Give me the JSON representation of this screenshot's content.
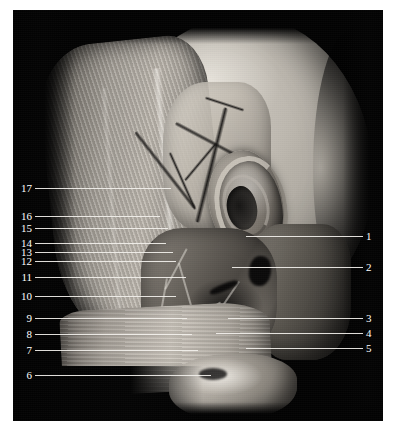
{
  "figure": {
    "kind": "anatomical-dissection-photograph",
    "plate_background": "#030303",
    "page_background": "#ffffff",
    "label_color": "#ffffff",
    "leader_color": "#f2f0ec"
  },
  "labels_left": [
    {
      "number": "17",
      "y": 188,
      "line_x": 35,
      "line_width": 136
    },
    {
      "number": "16",
      "y": 216,
      "line_x": 35,
      "line_width": 125
    },
    {
      "number": "15",
      "y": 228,
      "line_x": 35,
      "line_width": 133
    },
    {
      "number": "14",
      "y": 243,
      "line_x": 35,
      "line_width": 131
    },
    {
      "number": "13",
      "y": 252,
      "line_x": 35,
      "line_width": 138
    },
    {
      "number": "12",
      "y": 261,
      "line_x": 35,
      "line_width": 141
    },
    {
      "number": "11",
      "y": 277,
      "line_x": 35,
      "line_width": 151
    },
    {
      "number": "10",
      "y": 296,
      "line_x": 35,
      "line_width": 141
    },
    {
      "number": "9",
      "y": 318,
      "line_x": 35,
      "line_width": 152
    },
    {
      "number": "8",
      "y": 334,
      "line_x": 35,
      "line_width": 157
    },
    {
      "number": "7",
      "y": 350,
      "line_x": 35,
      "line_width": 163
    },
    {
      "number": "6",
      "y": 375,
      "line_x": 35,
      "line_width": 176
    }
  ],
  "labels_right": [
    {
      "number": "1",
      "y": 236,
      "line_x": 246,
      "line_width": 117
    },
    {
      "number": "2",
      "y": 267,
      "line_x": 232,
      "line_width": 131
    },
    {
      "number": "3",
      "y": 318,
      "line_x": 228,
      "line_width": 135
    },
    {
      "number": "4",
      "y": 333,
      "line_x": 216,
      "line_width": 147
    },
    {
      "number": "5",
      "y": 348,
      "line_x": 246,
      "line_width": 117
    }
  ]
}
